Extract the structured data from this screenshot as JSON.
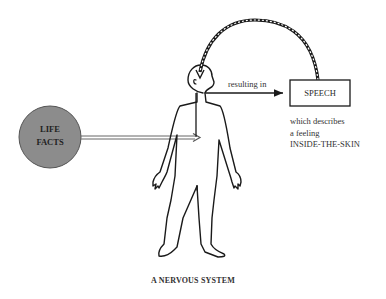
{
  "diagram": {
    "title": "A NERVOUS SYSTEM",
    "input_circle": {
      "line1": "LIFE",
      "line2": "FACTS",
      "fill_color": "#8c8c8c"
    },
    "arrow_label": "resulting in",
    "output_box": {
      "label": "SPEECH"
    },
    "description": {
      "line1": "which describes",
      "line2": "a feeling",
      "line3": "INSIDE-THE-SKIN"
    },
    "colors": {
      "stroke": "#1a1a1a",
      "background": "#ffffff",
      "circle": "#8c8c8c"
    }
  }
}
